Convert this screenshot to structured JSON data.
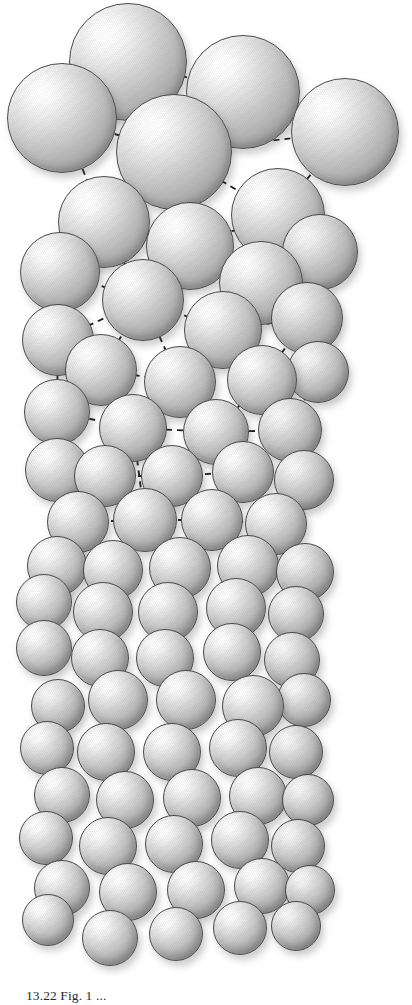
{
  "figure": {
    "kind": "scientific-illustration",
    "background_color": "#ffffff",
    "sphere_fill_highlight": "#ffffff",
    "sphere_fill_midtone": "#c6c6c6",
    "sphere_fill_shadow": "#838383",
    "sphere_outline_color": "#4a4a4a",
    "lattice_line_color": "#1b1b1b",
    "lattice_line_style": "dashed",
    "light_direction": "upper-left"
  },
  "caption": {
    "label": "13.22",
    "text": "13.22 Fig. 1 ..."
  },
  "chart_data": {
    "type": "scatter",
    "xlabel": "",
    "ylabel": "",
    "grid": false,
    "legend": "none",
    "note": "Spheres rendered in perspective: largest (nearest viewer) at top, receding downward. Dashed segments join sphere centres in the upper two thirds only.",
    "spheres": [
      {
        "cx": 128,
        "cy": 62,
        "r": 59,
        "depth": "near"
      },
      {
        "cx": 243,
        "cy": 92,
        "r": 57,
        "depth": "near"
      },
      {
        "cx": 62,
        "cy": 118,
        "r": 55,
        "depth": "near"
      },
      {
        "cx": 345,
        "cy": 132,
        "r": 54,
        "depth": "near"
      },
      {
        "cx": 174,
        "cy": 152,
        "r": 58,
        "depth": "near"
      },
      {
        "cx": 278,
        "cy": 215,
        "r": 47,
        "depth": "near"
      },
      {
        "cx": 104,
        "cy": 222,
        "r": 46,
        "depth": "near"
      },
      {
        "cx": 190,
        "cy": 246,
        "r": 44,
        "depth": "near"
      },
      {
        "cx": 60,
        "cy": 272,
        "r": 40,
        "depth": "mid"
      },
      {
        "cx": 261,
        "cy": 283,
        "r": 42,
        "depth": "mid"
      },
      {
        "cx": 320,
        "cy": 252,
        "r": 38,
        "depth": "far"
      },
      {
        "cx": 143,
        "cy": 300,
        "r": 41,
        "depth": "mid"
      },
      {
        "cx": 223,
        "cy": 330,
        "r": 39,
        "depth": "mid"
      },
      {
        "cx": 307,
        "cy": 318,
        "r": 36,
        "depth": "far"
      },
      {
        "cx": 58,
        "cy": 340,
        "r": 36,
        "depth": "mid"
      },
      {
        "cx": 101,
        "cy": 370,
        "r": 36,
        "depth": "mid"
      },
      {
        "cx": 180,
        "cy": 382,
        "r": 36,
        "depth": "mid"
      },
      {
        "cx": 262,
        "cy": 380,
        "r": 35,
        "depth": "mid"
      },
      {
        "cx": 318,
        "cy": 372,
        "r": 31,
        "depth": "far"
      },
      {
        "cx": 57,
        "cy": 412,
        "r": 33,
        "depth": "mid"
      },
      {
        "cx": 133,
        "cy": 428,
        "r": 34,
        "depth": "mid"
      },
      {
        "cx": 216,
        "cy": 432,
        "r": 33,
        "depth": "mid"
      },
      {
        "cx": 290,
        "cy": 430,
        "r": 32,
        "depth": "far"
      },
      {
        "cx": 57,
        "cy": 470,
        "r": 32,
        "depth": "mid"
      },
      {
        "cx": 105,
        "cy": 476,
        "r": 31,
        "depth": "mid"
      },
      {
        "cx": 172,
        "cy": 476,
        "r": 31,
        "depth": "mid"
      },
      {
        "cx": 243,
        "cy": 472,
        "r": 31,
        "depth": "mid"
      },
      {
        "cx": 304,
        "cy": 480,
        "r": 30,
        "depth": "far"
      },
      {
        "cx": 78,
        "cy": 522,
        "r": 31,
        "depth": "mid"
      },
      {
        "cx": 145,
        "cy": 520,
        "r": 32,
        "depth": "mid"
      },
      {
        "cx": 212,
        "cy": 520,
        "r": 31,
        "depth": "mid"
      },
      {
        "cx": 276,
        "cy": 524,
        "r": 31,
        "depth": "mid"
      },
      {
        "cx": 57,
        "cy": 566,
        "r": 30,
        "depth": "mid"
      },
      {
        "cx": 113,
        "cy": 570,
        "r": 30,
        "depth": "mid"
      },
      {
        "cx": 180,
        "cy": 568,
        "r": 31,
        "depth": "mid"
      },
      {
        "cx": 248,
        "cy": 566,
        "r": 31,
        "depth": "mid"
      },
      {
        "cx": 305,
        "cy": 572,
        "r": 29,
        "depth": "far"
      },
      {
        "cx": 44,
        "cy": 602,
        "r": 28,
        "depth": "mid"
      },
      {
        "cx": 103,
        "cy": 612,
        "r": 30,
        "depth": "mid"
      },
      {
        "cx": 168,
        "cy": 612,
        "r": 30,
        "depth": "mid"
      },
      {
        "cx": 236,
        "cy": 608,
        "r": 30,
        "depth": "mid"
      },
      {
        "cx": 296,
        "cy": 614,
        "r": 28,
        "depth": "far"
      },
      {
        "cx": 44,
        "cy": 648,
        "r": 28,
        "depth": "mid"
      },
      {
        "cx": 100,
        "cy": 658,
        "r": 29,
        "depth": "mid"
      },
      {
        "cx": 165,
        "cy": 658,
        "r": 29,
        "depth": "mid"
      },
      {
        "cx": 232,
        "cy": 652,
        "r": 29,
        "depth": "mid"
      },
      {
        "cx": 292,
        "cy": 660,
        "r": 28,
        "depth": "far"
      },
      {
        "cx": 118,
        "cy": 700,
        "r": 30,
        "depth": "mid"
      },
      {
        "cx": 186,
        "cy": 700,
        "r": 30,
        "depth": "mid"
      },
      {
        "cx": 253,
        "cy": 706,
        "r": 31,
        "depth": "mid"
      },
      {
        "cx": 58,
        "cy": 706,
        "r": 27,
        "depth": "far"
      },
      {
        "cx": 304,
        "cy": 700,
        "r": 27,
        "depth": "far"
      },
      {
        "cx": 47,
        "cy": 748,
        "r": 27,
        "depth": "mid"
      },
      {
        "cx": 106,
        "cy": 752,
        "r": 29,
        "depth": "mid"
      },
      {
        "cx": 172,
        "cy": 752,
        "r": 29,
        "depth": "mid"
      },
      {
        "cx": 238,
        "cy": 748,
        "r": 29,
        "depth": "mid"
      },
      {
        "cx": 296,
        "cy": 752,
        "r": 27,
        "depth": "far"
      },
      {
        "cx": 62,
        "cy": 795,
        "r": 28,
        "depth": "mid"
      },
      {
        "cx": 125,
        "cy": 800,
        "r": 29,
        "depth": "mid"
      },
      {
        "cx": 192,
        "cy": 798,
        "r": 29,
        "depth": "mid"
      },
      {
        "cx": 258,
        "cy": 796,
        "r": 29,
        "depth": "mid"
      },
      {
        "cx": 308,
        "cy": 800,
        "r": 26,
        "depth": "far"
      },
      {
        "cx": 46,
        "cy": 838,
        "r": 27,
        "depth": "mid"
      },
      {
        "cx": 108,
        "cy": 846,
        "r": 29,
        "depth": "mid"
      },
      {
        "cx": 174,
        "cy": 844,
        "r": 29,
        "depth": "mid"
      },
      {
        "cx": 240,
        "cy": 840,
        "r": 29,
        "depth": "mid"
      },
      {
        "cx": 298,
        "cy": 846,
        "r": 27,
        "depth": "far"
      },
      {
        "cx": 62,
        "cy": 888,
        "r": 28,
        "depth": "mid"
      },
      {
        "cx": 128,
        "cy": 892,
        "r": 29,
        "depth": "mid"
      },
      {
        "cx": 196,
        "cy": 890,
        "r": 29,
        "depth": "mid"
      },
      {
        "cx": 262,
        "cy": 886,
        "r": 28,
        "depth": "mid"
      },
      {
        "cx": 310,
        "cy": 890,
        "r": 25,
        "depth": "far"
      },
      {
        "cx": 48,
        "cy": 920,
        "r": 26,
        "depth": "mid"
      },
      {
        "cx": 110,
        "cy": 938,
        "r": 28,
        "depth": "mid"
      },
      {
        "cx": 176,
        "cy": 934,
        "r": 27,
        "depth": "mid"
      },
      {
        "cx": 240,
        "cy": 928,
        "r": 27,
        "depth": "mid"
      },
      {
        "cx": 296,
        "cy": 926,
        "r": 25,
        "depth": "far"
      }
    ],
    "lattice_edges": [
      [
        128,
        62,
        174,
        152
      ],
      [
        128,
        62,
        243,
        92
      ],
      [
        128,
        62,
        62,
        118
      ],
      [
        62,
        118,
        174,
        152
      ],
      [
        243,
        92,
        174,
        152
      ],
      [
        243,
        92,
        345,
        132
      ],
      [
        345,
        132,
        174,
        152
      ],
      [
        345,
        132,
        278,
        215
      ],
      [
        174,
        152,
        278,
        215
      ],
      [
        174,
        152,
        104,
        222
      ],
      [
        174,
        152,
        190,
        246
      ],
      [
        104,
        222,
        190,
        246
      ],
      [
        190,
        246,
        278,
        215
      ],
      [
        62,
        118,
        104,
        222
      ],
      [
        104,
        222,
        60,
        272
      ],
      [
        190,
        246,
        261,
        283
      ],
      [
        278,
        215,
        261,
        283
      ],
      [
        278,
        215,
        320,
        252
      ],
      [
        320,
        252,
        261,
        283
      ],
      [
        261,
        283,
        307,
        318
      ],
      [
        60,
        272,
        143,
        300
      ],
      [
        104,
        222,
        143,
        300
      ],
      [
        190,
        246,
        143,
        300
      ],
      [
        143,
        300,
        223,
        330
      ],
      [
        261,
        283,
        223,
        330
      ],
      [
        223,
        330,
        307,
        318
      ],
      [
        60,
        272,
        58,
        340
      ],
      [
        58,
        340,
        143,
        300
      ],
      [
        58,
        340,
        101,
        370
      ],
      [
        101,
        370,
        143,
        300
      ],
      [
        101,
        370,
        180,
        382
      ],
      [
        180,
        382,
        143,
        300
      ],
      [
        180,
        382,
        223,
        330
      ],
      [
        223,
        330,
        262,
        380
      ],
      [
        262,
        380,
        307,
        318
      ],
      [
        262,
        380,
        318,
        372
      ],
      [
        307,
        318,
        318,
        372
      ],
      [
        58,
        340,
        57,
        412
      ],
      [
        57,
        412,
        101,
        370
      ],
      [
        57,
        412,
        133,
        428
      ],
      [
        133,
        428,
        101,
        370
      ],
      [
        133,
        428,
        180,
        382
      ],
      [
        133,
        428,
        216,
        432
      ],
      [
        216,
        432,
        180,
        382
      ],
      [
        216,
        432,
        262,
        380
      ],
      [
        262,
        380,
        290,
        430
      ],
      [
        290,
        430,
        318,
        372
      ],
      [
        216,
        432,
        290,
        430
      ],
      [
        57,
        412,
        57,
        470
      ],
      [
        57,
        470,
        105,
        476
      ],
      [
        105,
        476,
        133,
        428
      ],
      [
        105,
        476,
        172,
        476
      ],
      [
        172,
        476,
        133,
        428
      ],
      [
        172,
        476,
        216,
        432
      ],
      [
        172,
        476,
        243,
        472
      ],
      [
        243,
        472,
        216,
        432
      ],
      [
        243,
        472,
        290,
        430
      ],
      [
        243,
        472,
        304,
        480
      ],
      [
        304,
        480,
        290,
        430
      ],
      [
        105,
        476,
        145,
        520
      ],
      [
        145,
        520,
        133,
        428
      ],
      [
        145,
        520,
        172,
        476
      ],
      [
        145,
        520,
        212,
        520
      ],
      [
        212,
        520,
        172,
        476
      ],
      [
        212,
        520,
        243,
        472
      ],
      [
        78,
        522,
        105,
        476
      ],
      [
        78,
        522,
        57,
        470
      ],
      [
        78,
        522,
        145,
        520
      ],
      [
        243,
        472,
        276,
        524
      ],
      [
        276,
        524,
        304,
        480
      ],
      [
        276,
        524,
        212,
        520
      ]
    ]
  }
}
